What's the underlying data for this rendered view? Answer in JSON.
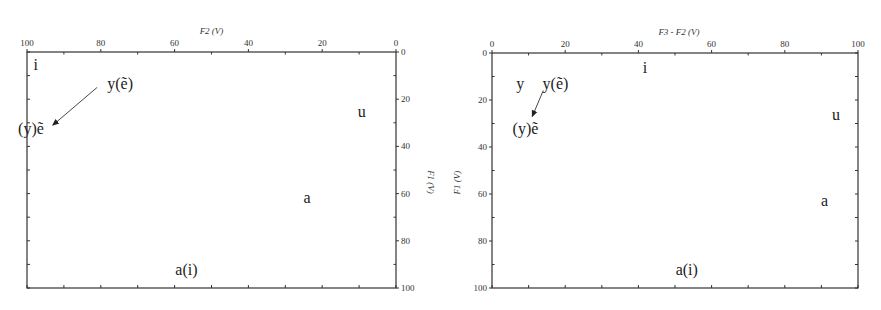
{
  "chart_data": [
    {
      "type": "scatter",
      "title": "",
      "xlabel": "F2 (V)",
      "ylabel": "F1 (V)",
      "xlim": [
        100,
        0
      ],
      "ylim": [
        0,
        100
      ],
      "x_axis_position": "top",
      "y_axis_position": "right",
      "x_reversed": true,
      "y_reversed": true,
      "xticks": [
        100,
        80,
        60,
        40,
        20,
        0
      ],
      "yticks": [
        0,
        20,
        40,
        60,
        80,
        100
      ],
      "minor_tick_step": 10,
      "grid": false,
      "points": [
        {
          "label": "i",
          "x": 98,
          "y": 5
        },
        {
          "label": "y(ẽ)",
          "x": 75,
          "y": 14
        },
        {
          "label": "(y)ẽ",
          "x": 97,
          "y": 32
        },
        {
          "label": "u",
          "x": 9,
          "y": 25
        },
        {
          "label": "a",
          "x": 24,
          "y": 62
        },
        {
          "label": "a(i)",
          "x": 56,
          "y": 92
        }
      ],
      "arrows": [
        {
          "from": [
            81,
            15
          ],
          "to": [
            93,
            31
          ]
        }
      ]
    },
    {
      "type": "scatter",
      "title": "",
      "xlabel": "F3 - F2 (V)",
      "ylabel": "F1 (V)",
      "xlim": [
        0,
        100
      ],
      "ylim": [
        0,
        100
      ],
      "x_axis_position": "top",
      "y_axis_position": "left",
      "x_reversed": false,
      "y_reversed": true,
      "xticks": [
        0,
        20,
        40,
        60,
        80,
        100
      ],
      "yticks": [
        0,
        20,
        40,
        60,
        80,
        100
      ],
      "minor_tick_step": 10,
      "grid": false,
      "points": [
        {
          "label": "i",
          "x": 42,
          "y": 6
        },
        {
          "label": "y",
          "x": 8,
          "y": 13
        },
        {
          "label": "y(ẽ)",
          "x": 16,
          "y": 13
        },
        {
          "label": "(y)ẽ",
          "x": 10,
          "y": 32
        },
        {
          "label": "u",
          "x": 94,
          "y": 26
        },
        {
          "label": "a",
          "x": 91,
          "y": 63
        },
        {
          "label": "a(i)",
          "x": 54,
          "y": 92
        }
      ],
      "arrows": [
        {
          "from": [
            14,
            16
          ],
          "to": [
            11,
            27
          ]
        }
      ]
    }
  ]
}
